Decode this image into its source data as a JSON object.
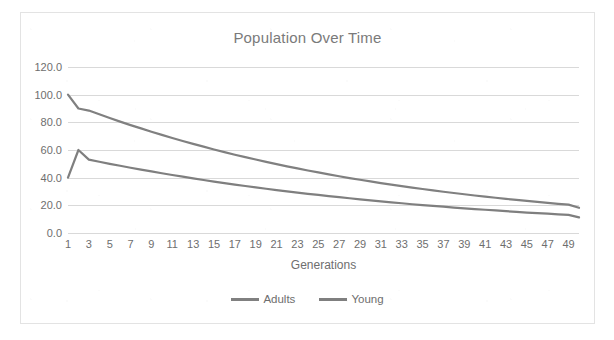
{
  "chart_data": {
    "type": "line",
    "title": "Population Over Time",
    "xlabel": "Generations",
    "ylabel": "",
    "xlim": [
      1,
      50
    ],
    "ylim": [
      0,
      120
    ],
    "grid": true,
    "legend_position": "bottom",
    "ytick_labels": [
      "0.0",
      "20.0",
      "40.0",
      "60.0",
      "80.0",
      "100.0",
      "120.0"
    ],
    "ytick_values": [
      0,
      20,
      40,
      60,
      80,
      100,
      120
    ],
    "xtick_labels": [
      "1",
      "3",
      "5",
      "7",
      "9",
      "11",
      "13",
      "15",
      "17",
      "19",
      "21",
      "23",
      "25",
      "27",
      "29",
      "31",
      "33",
      "35",
      "37",
      "39",
      "41",
      "43",
      "45",
      "47",
      "49"
    ],
    "xtick_values": [
      1,
      3,
      5,
      7,
      9,
      11,
      13,
      15,
      17,
      19,
      21,
      23,
      25,
      27,
      29,
      31,
      33,
      35,
      37,
      39,
      41,
      43,
      45,
      47,
      49
    ],
    "x": [
      1,
      2,
      3,
      4,
      5,
      6,
      7,
      8,
      9,
      10,
      11,
      12,
      13,
      14,
      15,
      16,
      17,
      18,
      19,
      20,
      21,
      22,
      23,
      24,
      25,
      26,
      27,
      28,
      29,
      30,
      31,
      32,
      33,
      34,
      35,
      36,
      37,
      38,
      39,
      40,
      41,
      42,
      43,
      44,
      45,
      46,
      47,
      48,
      49,
      50
    ],
    "series": [
      {
        "name": "Adults",
        "color": "#808080",
        "values": [
          100.0,
          90.0,
          88.5,
          85.8,
          83.1,
          80.5,
          78.0,
          75.6,
          73.2,
          70.9,
          68.7,
          66.5,
          64.4,
          62.4,
          60.4,
          58.5,
          56.6,
          54.8,
          53.1,
          51.4,
          49.8,
          48.2,
          46.7,
          45.2,
          43.8,
          42.4,
          41.0,
          39.7,
          38.5,
          37.3,
          36.1,
          35.0,
          33.9,
          32.8,
          31.8,
          30.8,
          29.8,
          28.9,
          28.0,
          27.1,
          26.3,
          25.5,
          24.7,
          23.9,
          23.2,
          22.5,
          21.8,
          21.1,
          20.5,
          18.2
        ]
      },
      {
        "name": "Young",
        "color": "#7f7f7f",
        "values": [
          40.0,
          60.0,
          53.0,
          51.5,
          50.0,
          48.6,
          47.2,
          45.8,
          44.5,
          43.2,
          41.9,
          40.7,
          39.5,
          38.3,
          37.2,
          36.1,
          35.0,
          34.0,
          33.0,
          32.0,
          31.0,
          30.1,
          29.2,
          28.3,
          27.5,
          26.7,
          25.9,
          25.1,
          24.3,
          23.6,
          22.9,
          22.2,
          21.5,
          20.8,
          20.2,
          19.6,
          19.0,
          18.4,
          17.8,
          17.3,
          16.8,
          16.3,
          15.8,
          15.3,
          14.8,
          14.4,
          14.0,
          13.5,
          13.1,
          11.3
        ]
      }
    ]
  },
  "legend": {
    "entries": [
      {
        "label": "Adults"
      },
      {
        "label": "Young"
      }
    ]
  }
}
